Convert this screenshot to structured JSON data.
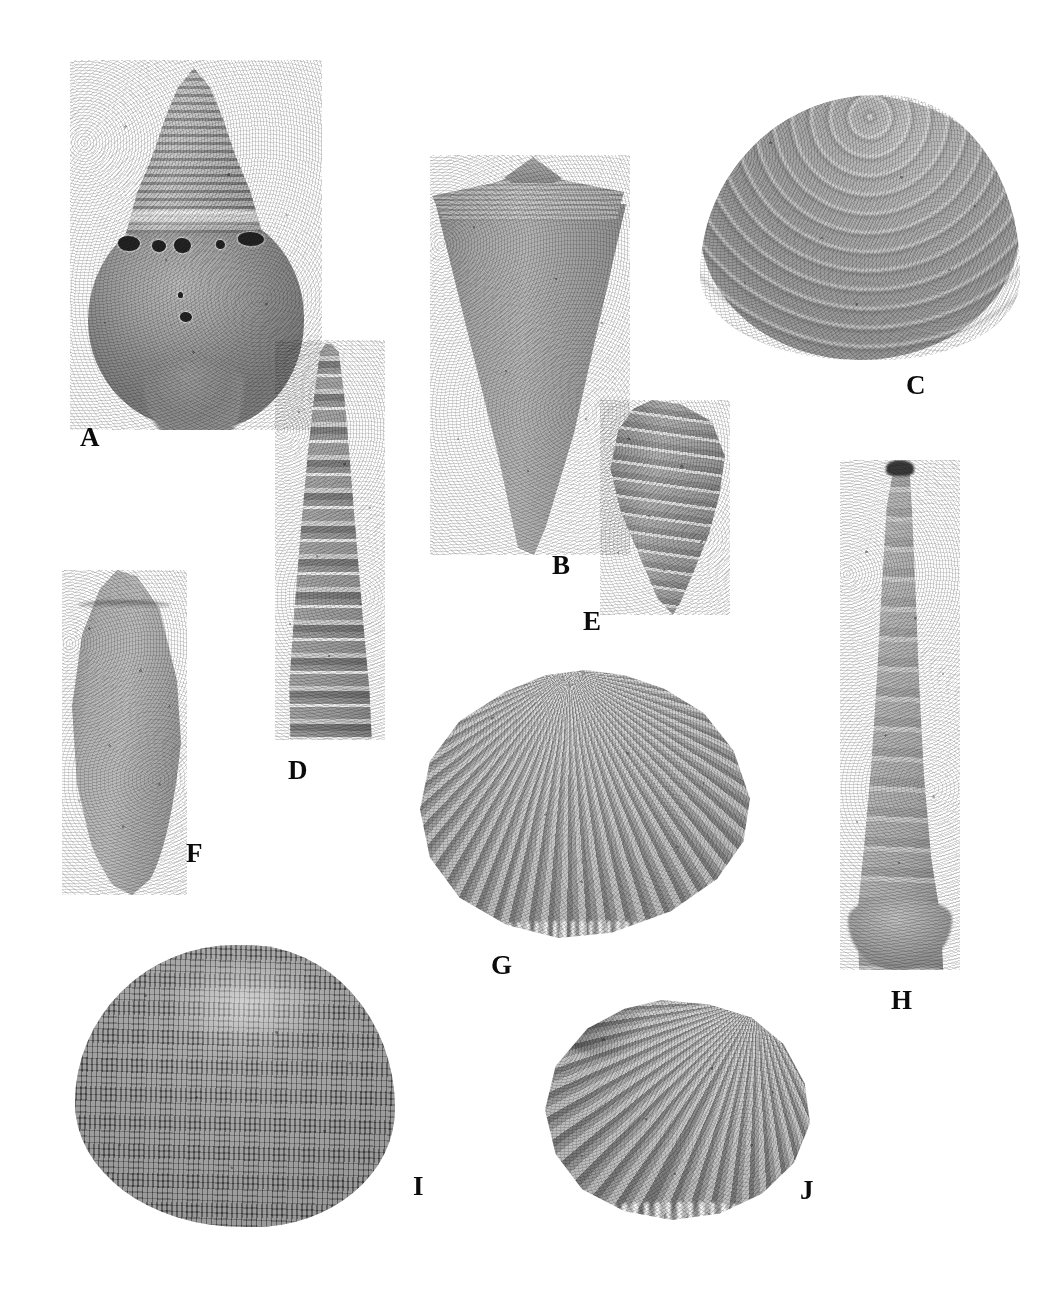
{
  "plate": {
    "kind": "fossil-mollusc-photographic-plate",
    "background_color": "#ffffff",
    "label_color": "#0b0b0b",
    "width": 1039,
    "height": 1310,
    "specimen_count": 10
  },
  "specimens": [
    {
      "label": "A",
      "name": "turbinate gastropod with bored body whorl",
      "group": "gastropod",
      "label_x": 80,
      "label_y": 424,
      "tone": "#a0a0a0"
    },
    {
      "label": "B",
      "name": "cone shell",
      "group": "gastropod",
      "label_x": 552,
      "label_y": 552,
      "tone": "#aaaaaa"
    },
    {
      "label": "C",
      "name": "concentrically ribbed venerid bivalve",
      "group": "bivalve",
      "label_x": 906,
      "label_y": 372,
      "tone": "#b3b3b3"
    },
    {
      "label": "D",
      "name": "turreted gastropod with beaded whorls",
      "group": "gastropod",
      "label_x": 288,
      "label_y": 757,
      "tone": "#a5a5a5"
    },
    {
      "label": "E",
      "name": "small ribbed fusiform gastropod",
      "group": "gastropod",
      "label_x": 583,
      "label_y": 608,
      "tone": "#a6a6a6"
    },
    {
      "label": "F",
      "name": "smooth elongate olive shell",
      "group": "gastropod",
      "label_x": 186,
      "label_y": 840,
      "tone": "#b2b2b2"
    },
    {
      "label": "G",
      "name": "radially ribbed cockle bivalve",
      "group": "bivalve",
      "label_x": 491,
      "label_y": 952,
      "tone": "#b8b8b8"
    },
    {
      "label": "H",
      "name": "long tapering turritellid gastropod",
      "group": "gastropod",
      "label_x": 891,
      "label_y": 987,
      "tone": "#aeaeae"
    },
    {
      "label": "I",
      "name": "large rounded bivalve with cancellate sculpture",
      "group": "bivalve",
      "label_x": 413,
      "label_y": 1173,
      "tone": "#757575"
    },
    {
      "label": "J",
      "name": "ribbed bivalve with crenulate margin",
      "group": "bivalve",
      "label_x": 800,
      "label_y": 1177,
      "tone": "#b0b0b0"
    }
  ]
}
